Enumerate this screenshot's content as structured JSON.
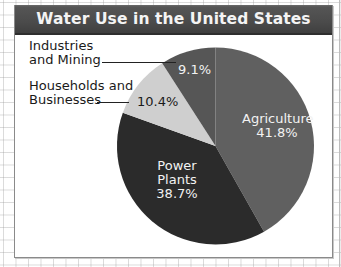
{
  "title": "Water Use in the United States",
  "chart_data": {
    "type": "pie",
    "title": "Water Use in the United States",
    "categories": [
      "Agriculture",
      "Power Plants",
      "Households and Businesses",
      "Industries and Mining"
    ],
    "values": [
      41.8,
      38.7,
      10.4,
      9.1
    ],
    "unit": "%",
    "colors": [
      "#606060",
      "#2b2b2b",
      "#cfcfcf",
      "#565656"
    ],
    "start_angle_deg": 0,
    "direction": "clockwise",
    "legend": "none (direct labels)"
  },
  "labels": {
    "industries": {
      "line1": "Industries",
      "line2": "and Mining",
      "value": "9.1%"
    },
    "households": {
      "line1": "Households and",
      "line2": "Businesses",
      "value": "10.4%"
    },
    "agriculture": {
      "name": "Agriculture",
      "value": "41.8%"
    },
    "power": {
      "line1": "Power",
      "line2": "Plants",
      "value": "38.7%"
    }
  }
}
